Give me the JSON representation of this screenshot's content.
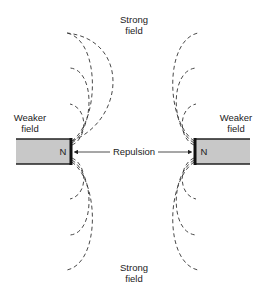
{
  "diagram": {
    "top_label_line1": "Strong",
    "top_label_line2": "field",
    "bottom_label_line1": "Strong",
    "bottom_label_line2": "field",
    "left_label_line1": "Weaker",
    "left_label_line2": "field",
    "right_label_line1": "Weaker",
    "right_label_line2": "field",
    "left_pole": "N",
    "right_pole": "N",
    "force_label": "Repulsion",
    "colors": {
      "magnet_fill": "#c8c8c8",
      "line": "#333333"
    }
  }
}
